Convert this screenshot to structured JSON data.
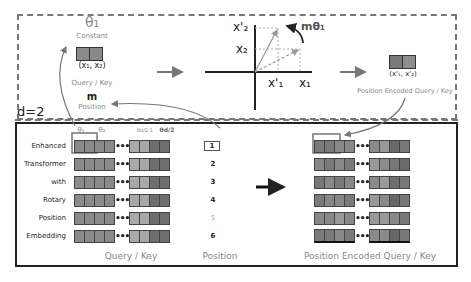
{
  "diagram": {
    "dimension_label": "d=2",
    "top_panel": {
      "theta_label": "θ₁",
      "constant_label": "Constant",
      "input_pair_label": "(x₁, x₂)",
      "query_key_label": "Query / Key",
      "m_label": "m",
      "position_label": "Position",
      "rotation_label": "mθ₁",
      "axis_labels": {
        "x1": "x₁",
        "x2": "x₂",
        "x1_prime": "x'₁",
        "x2_prime": "x'₂"
      },
      "output_pair_label": "(x'₁, x'₂)",
      "output_label": "Position Encoded Query / Key"
    },
    "bottom_panel": {
      "theta_headers": [
        "θ₁",
        "θ₂",
        "θd/2-1",
        "θd/2"
      ],
      "rows": [
        {
          "word": "Enhanced",
          "position": "1"
        },
        {
          "word": "Transformer",
          "position": "2"
        },
        {
          "word": "with",
          "position": "3"
        },
        {
          "word": "Rotary",
          "position": "4"
        },
        {
          "word": "Position",
          "position": "5"
        },
        {
          "word": "Embedding",
          "position": "6"
        }
      ],
      "ellipsis": "•••",
      "query_key_footer": "Query / Key",
      "position_footer": "Position",
      "encoded_footer": "Position Encoded Query / Key"
    },
    "colors": {
      "dashed_border": "#777777",
      "solid_border": "#222222",
      "cell_gray": "#8a8a8a",
      "cell_light": "#a8a8a8",
      "cell_dark": "#6e6e6e",
      "highlight_box": "#777777",
      "label_gray": "#888888"
    }
  }
}
